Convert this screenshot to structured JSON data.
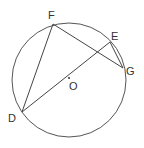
{
  "diagram": {
    "type": "circle-geometry",
    "circle": {
      "cx": 69,
      "cy": 80,
      "r": 57
    },
    "center": {
      "label": "O",
      "x": 69,
      "y": 78
    },
    "points": {
      "F": {
        "x": 53,
        "y": 24
      },
      "E": {
        "x": 110,
        "y": 42
      },
      "G": {
        "x": 123,
        "y": 68
      },
      "D": {
        "x": 22,
        "y": 112
      }
    },
    "segments": [
      [
        "D",
        "F"
      ],
      [
        "F",
        "G"
      ],
      [
        "D",
        "E"
      ],
      [
        "E",
        "G"
      ]
    ],
    "labels": {
      "F": "F",
      "E": "E",
      "G": "G",
      "D": "D",
      "O": "O"
    },
    "colors": {
      "stroke": "#555555",
      "text": "#333333"
    }
  }
}
